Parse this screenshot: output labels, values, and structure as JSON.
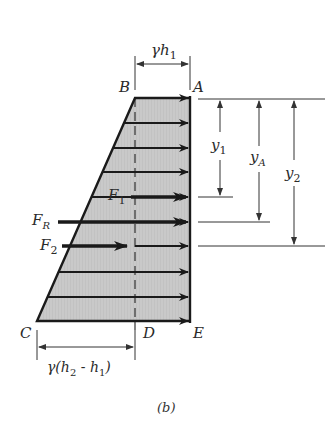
{
  "figure": {
    "caption": "(b)",
    "points": {
      "A": "A",
      "B": "B",
      "C": "C",
      "D": "D",
      "E": "E"
    },
    "top_dimension": {
      "gamma": "γ",
      "h": "h",
      "sub": "1"
    },
    "bottom_dimension": {
      "prefix": "γ(",
      "h2": "h",
      "h2_sub": "2",
      "minus": " - ",
      "h1": "h",
      "h1_sub": "1",
      "suffix": ")"
    },
    "forces": {
      "F1": {
        "base": "F",
        "sub": "1"
      },
      "FR": {
        "base": "F",
        "sub": "R"
      },
      "F2": {
        "base": "F",
        "sub": "2"
      }
    },
    "distances": {
      "y1": {
        "base": "y",
        "sub": "1"
      },
      "yA": {
        "base": "y",
        "sub": "A"
      },
      "y2": {
        "base": "y",
        "sub": "2"
      }
    },
    "colors": {
      "fill": "#c9c9c9",
      "stroke": "#1a1a1a"
    }
  }
}
